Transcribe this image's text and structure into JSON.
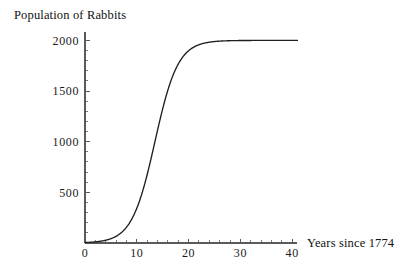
{
  "chart_data": {
    "type": "line",
    "title": "Population of Rabbits",
    "xlabel": "Years since 1774",
    "ylabel": "",
    "grid": false,
    "legend": "none",
    "xlim": [
      0,
      41
    ],
    "ylim": [
      0,
      2080
    ],
    "x_major_ticks": [
      0,
      10,
      20,
      30,
      40
    ],
    "x_major_tick_labels": [
      "0",
      "10",
      "20",
      "30",
      "40"
    ],
    "x_minor_tick_step": 2,
    "y_major_ticks": [
      500,
      1000,
      1500,
      2000
    ],
    "y_major_tick_labels": [
      "500",
      "1000",
      "1500",
      "2000"
    ],
    "y_minor_tick_step": 100,
    "curve_model": "logistic",
    "carrying_capacity": 2000,
    "midpoint_year": 13.5,
    "growth_rate": 0.45,
    "initial_population": 8,
    "series": [
      {
        "name": "Population of Rabbits",
        "color": "#1f1f1f",
        "x": [
          0,
          1,
          2,
          3,
          4,
          5,
          6,
          7,
          8,
          9,
          10,
          11,
          12,
          13,
          14,
          15,
          16,
          17,
          18,
          19,
          20,
          21,
          22,
          23,
          24,
          25,
          26,
          27,
          28,
          29,
          30,
          31,
          32,
          33,
          34,
          35,
          36,
          37,
          38,
          39,
          40,
          41
        ],
        "values": [
          5,
          8,
          12,
          19,
          30,
          47,
          73,
          113,
          173,
          262,
          389,
          561,
          779,
          1031,
          1290,
          1525,
          1713,
          1845,
          1925,
          1969,
          1991,
          2000,
          2000,
          2000,
          2000,
          2000,
          2000,
          2000,
          2000,
          2000,
          2000,
          2000,
          2000,
          2000,
          2000,
          2000,
          2000,
          2000,
          2000,
          2000,
          2000,
          2000
        ]
      }
    ],
    "axis_color": "#5a5a5a",
    "curve_color": "#1f1f1f"
  },
  "figure": {
    "title": "Population of Rabbits",
    "x_axis_label": "Years since 1774"
  }
}
